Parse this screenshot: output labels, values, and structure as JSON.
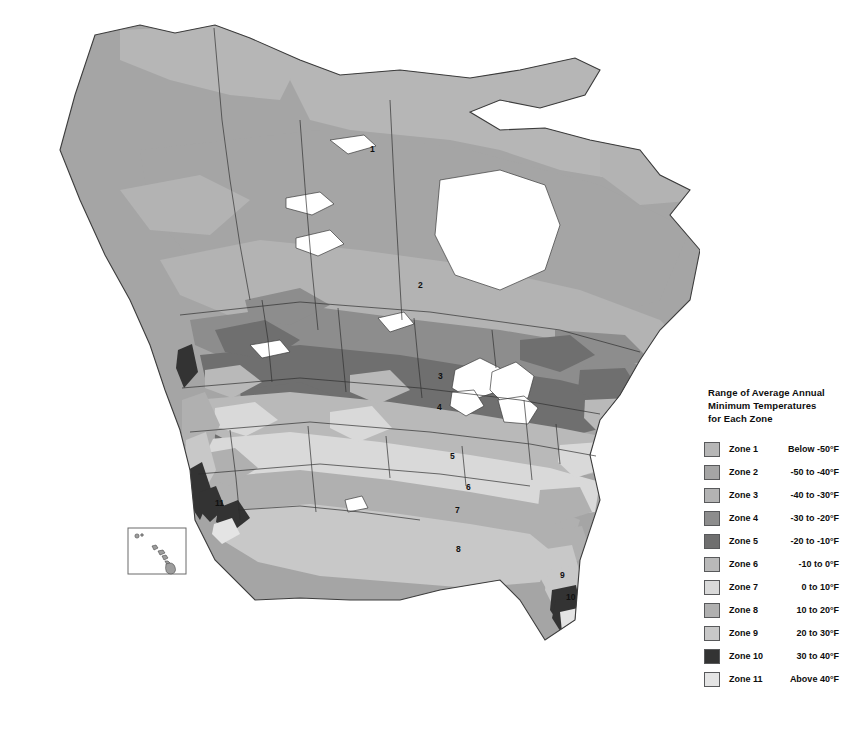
{
  "map": {
    "title": "Plant Hardiness Zone Map of North America",
    "projection": "north-america-grayscale",
    "background_color": "#ffffff",
    "outline_color": "#3c3c3c",
    "inset": {
      "name": "hawaii-inset",
      "border_color": "#6b6b6b"
    },
    "zone_labels": [
      {
        "zone": "1",
        "x": 370,
        "y": 145
      },
      {
        "zone": "2",
        "x": 418,
        "y": 281
      },
      {
        "zone": "3",
        "x": 438,
        "y": 372
      },
      {
        "zone": "4",
        "x": 437,
        "y": 403
      },
      {
        "zone": "5",
        "x": 450,
        "y": 452
      },
      {
        "zone": "6",
        "x": 466,
        "y": 483
      },
      {
        "zone": "7",
        "x": 455,
        "y": 506
      },
      {
        "zone": "8",
        "x": 456,
        "y": 545
      },
      {
        "zone": "9",
        "x": 560,
        "y": 571
      },
      {
        "zone": "10",
        "x": 566,
        "y": 593
      },
      {
        "zone": "11",
        "x": 215,
        "y": 499
      }
    ]
  },
  "legend": {
    "title_lines": [
      "Range of Average Annual",
      "Minimum Temperatures",
      "for Each Zone"
    ],
    "rows": [
      {
        "zone": "Zone 1",
        "range": "Below -50°F",
        "color": "#b6b6b6"
      },
      {
        "zone": "Zone 2",
        "range": "-50 to -40°F",
        "color": "#a5a5a5"
      },
      {
        "zone": "Zone 3",
        "range": "-40 to -30°F",
        "color": "#b3b3b3"
      },
      {
        "zone": "Zone 4",
        "range": "-30 to -20°F",
        "color": "#8d8d8d"
      },
      {
        "zone": "Zone 5",
        "range": "-20 to -10°F",
        "color": "#6f6f6f"
      },
      {
        "zone": "Zone 6",
        "range": "-10 to 0°F",
        "color": "#b9b9b9"
      },
      {
        "zone": "Zone 7",
        "range": "0 to 10°F",
        "color": "#d9d9d9"
      },
      {
        "zone": "Zone 8",
        "range": "10 to 20°F",
        "color": "#b0b0b0"
      },
      {
        "zone": "Zone 9",
        "range": "20 to 30°F",
        "color": "#c8c8c8"
      },
      {
        "zone": "Zone 10",
        "range": "30 to 40°F",
        "color": "#333333"
      },
      {
        "zone": "Zone 11",
        "range": "Above 40°F",
        "color": "#e4e4e4"
      }
    ]
  },
  "chart_data": {
    "type": "map",
    "title": "Range of Average Annual Minimum Temperatures for Each Zone",
    "legend_position": "right",
    "categories": [
      "Zone 1",
      "Zone 2",
      "Zone 3",
      "Zone 4",
      "Zone 5",
      "Zone 6",
      "Zone 7",
      "Zone 8",
      "Zone 9",
      "Zone 10",
      "Zone 11"
    ],
    "value_labels": [
      "Below -50°F",
      "-50 to -40°F",
      "-40 to -30°F",
      "-30 to -20°F",
      "-20 to -10°F",
      "-10 to 0°F",
      "0 to 10°F",
      "10 to 20°F",
      "20 to 30°F",
      "30 to 40°F",
      "Above 40°F"
    ],
    "lower_bound_F": [
      null,
      -50,
      -40,
      -30,
      -20,
      -10,
      0,
      10,
      20,
      30,
      40
    ],
    "upper_bound_F": [
      -50,
      -40,
      -30,
      -20,
      -10,
      0,
      10,
      20,
      30,
      40,
      null
    ],
    "colors": [
      "#b6b6b6",
      "#a5a5a5",
      "#b3b3b3",
      "#8d8d8d",
      "#6f6f6f",
      "#b9b9b9",
      "#d9d9d9",
      "#b0b0b0",
      "#c8c8c8",
      "#333333",
      "#e4e4e4"
    ],
    "xlabel": "",
    "ylabel": "",
    "grid": false
  }
}
